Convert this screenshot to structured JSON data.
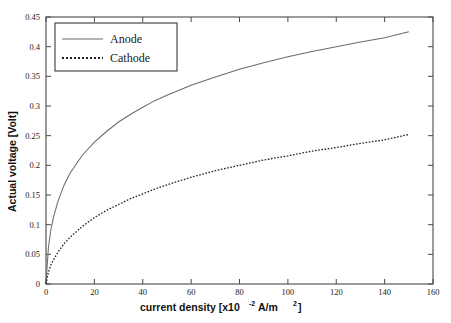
{
  "chart_data": {
    "type": "line",
    "title": "",
    "xlabel": "current density [x10-2 A/m2]",
    "xlabel_main": "current density [x10",
    "xlabel_exp": "-2",
    "xlabel_tail": " A/m",
    "xlabel_exp2": "2",
    "xlabel_end": "]",
    "ylabel": "Actual voltage [Volt]",
    "xlim": [
      0,
      160
    ],
    "ylim": [
      0,
      0.45
    ],
    "grid": false,
    "legend_position": "upper-left",
    "xticks": [
      0,
      20,
      40,
      60,
      80,
      100,
      120,
      140,
      160
    ],
    "xtick_labels": [
      "0",
      "20",
      "40",
      "60",
      "80",
      "100",
      "120",
      "140",
      "160"
    ],
    "yticks": [
      0,
      0.05,
      0.1,
      0.15,
      0.2,
      0.25,
      0.3,
      0.35,
      0.4,
      0.45
    ],
    "ytick_labels": [
      "0",
      "0.05",
      "0.1",
      "0.15",
      "0.2",
      "0.25",
      "0.3",
      "0.35",
      "0.4",
      "0.45"
    ],
    "x": [
      0,
      1,
      2,
      3,
      5,
      7.5,
      10,
      15,
      20,
      25,
      30,
      35,
      40,
      45,
      50,
      60,
      70,
      80,
      90,
      100,
      110,
      120,
      130,
      140,
      150
    ],
    "series": [
      {
        "name": "Anode",
        "style": "solid",
        "color": "#6b6b6b",
        "values": [
          0,
          0.043,
          0.063,
          0.077,
          0.097,
          0.116,
          0.13,
          0.151,
          0.166,
          0.179,
          0.19,
          0.199,
          0.207,
          0.214,
          0.221,
          0.233,
          0.243,
          0.252,
          0.26,
          0.267,
          0.273,
          0.279,
          0.284,
          0.289,
          0.293
        ]
      },
      {
        "name": "Cathode",
        "style": "dotted",
        "color": "#222222",
        "values": [
          0,
          0.012,
          0.019,
          0.024,
          0.032,
          0.04,
          0.047,
          0.058,
          0.067,
          0.074,
          0.081,
          0.087,
          0.092,
          0.097,
          0.101,
          0.109,
          0.116,
          0.122,
          0.127,
          0.132,
          0.136,
          0.14,
          0.144,
          0.148,
          0.151
        ]
      }
    ],
    "anode_values_actual": [
      0,
      0.062,
      0.091,
      0.111,
      0.14,
      0.167,
      0.187,
      0.217,
      0.239,
      0.257,
      0.273,
      0.286,
      0.298,
      0.309,
      0.318,
      0.335,
      0.349,
      0.362,
      0.373,
      0.383,
      0.392,
      0.4,
      0.408,
      0.415,
      0.425
    ],
    "cathode_values_actual": [
      0,
      0.02,
      0.032,
      0.04,
      0.054,
      0.068,
      0.079,
      0.097,
      0.112,
      0.124,
      0.134,
      0.144,
      0.152,
      0.16,
      0.167,
      0.18,
      0.191,
      0.2,
      0.209,
      0.216,
      0.224,
      0.23,
      0.237,
      0.243,
      0.252
    ]
  },
  "legend": {
    "items": [
      {
        "label": "Anode",
        "style": "solid"
      },
      {
        "label": "Cathode",
        "style": "dotted"
      }
    ]
  }
}
